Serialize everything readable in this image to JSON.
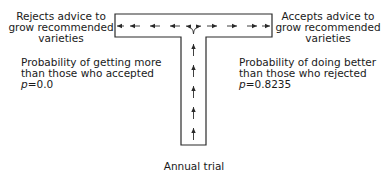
{
  "diagram": {
    "type": "T-shaped flow diagram",
    "left_outcome": {
      "lines": [
        "Rejects advice to",
        "grow recommended",
        "varieties"
      ]
    },
    "right_outcome": {
      "lines": [
        "Accepts advice to",
        "grow recommended",
        "varieties"
      ]
    },
    "left_probability": {
      "lines": [
        "Probability of getting more",
        "than those who accepted"
      ],
      "p_symbol": "p",
      "p_value": "=0.0"
    },
    "right_probability": {
      "lines": [
        "Probability of doing better",
        "than those who rejected"
      ],
      "p_symbol": "p",
      "p_value": "=0.8235"
    },
    "stem_label": "Annual trial",
    "colors": {
      "line": "#2a2a2a",
      "background": "#ffffff"
    }
  }
}
